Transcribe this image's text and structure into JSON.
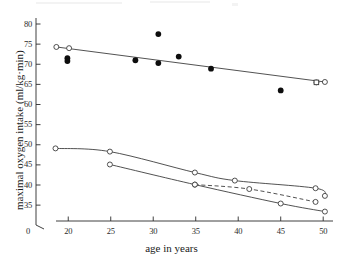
{
  "chart_data": {
    "type": "scatter",
    "title": "",
    "xlabel": "age in years",
    "ylabel": "maximal oxygen intake (ml/kg·min)",
    "xlim": [
      17.5,
      50.8
    ],
    "ylim": [
      32.3,
      80.5
    ],
    "xticks": [
      20,
      25,
      30,
      35,
      40,
      45,
      50
    ],
    "xtick_labels": [
      "20",
      "25",
      "30",
      "35",
      "40",
      "45",
      "50"
    ],
    "yticks": [
      35,
      40,
      45,
      50,
      55,
      60,
      65,
      70,
      75,
      80
    ],
    "ytick_labels": [
      "35",
      "40",
      "45",
      "50",
      "55",
      "60",
      "65",
      "70",
      "75",
      "80"
    ],
    "axis_break_label": "0",
    "grid": false,
    "legend": "none",
    "series": [
      {
        "name": "observed maximal oxygen intake",
        "marker": "filled-circle",
        "line": "none",
        "points": [
          {
            "x": 19.9,
            "y": 71.5
          },
          {
            "x": 19.9,
            "y": 70.8
          },
          {
            "x": 27.9,
            "y": 71.0
          },
          {
            "x": 30.6,
            "y": 77.5
          },
          {
            "x": 30.6,
            "y": 70.3
          },
          {
            "x": 33.0,
            "y": 71.9
          },
          {
            "x": 36.8,
            "y": 68.9
          },
          {
            "x": 45.0,
            "y": 63.5
          }
        ]
      },
      {
        "name": "fitted regression line",
        "marker": "open-circle",
        "line": "solid",
        "points": [
          {
            "x": 18.6,
            "y": 74.3
          },
          {
            "x": 20.1,
            "y": 74.0
          },
          {
            "x": 49.2,
            "y": 65.5
          },
          {
            "x": 50.2,
            "y": 65.6
          }
        ]
      },
      {
        "name": "predicted upper curve",
        "marker": "open-circle",
        "line": "solid",
        "points": [
          {
            "x": 18.5,
            "y": 49.1
          },
          {
            "x": 24.9,
            "y": 48.3
          },
          {
            "x": 34.9,
            "y": 43.1
          },
          {
            "x": 39.6,
            "y": 41.1
          },
          {
            "x": 49.1,
            "y": 39.2
          },
          {
            "x": 50.2,
            "y": 37.3
          }
        ]
      },
      {
        "name": "predicted middle dashed curve",
        "marker": "open-circle",
        "line": "dashed",
        "points": [
          {
            "x": 34.9,
            "y": 40.1
          },
          {
            "x": 41.3,
            "y": 39.0
          },
          {
            "x": 49.1,
            "y": 35.8
          }
        ]
      },
      {
        "name": "predicted lower curve",
        "marker": "open-circle",
        "line": "solid",
        "points": [
          {
            "x": 24.9,
            "y": 45.1
          },
          {
            "x": 34.9,
            "y": 40.1
          },
          {
            "x": 45.0,
            "y": 35.4
          },
          {
            "x": 50.2,
            "y": 33.4
          }
        ]
      }
    ]
  }
}
